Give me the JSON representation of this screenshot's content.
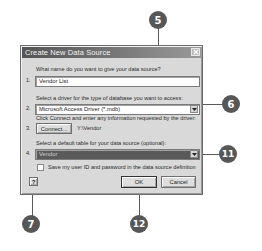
{
  "dialog": {
    "title": "Create New Data Source",
    "close_label": "×",
    "steps": [
      {
        "number": "1.",
        "label": "What name do you want to give your data source?",
        "value": "Vendor List"
      },
      {
        "number": "2.",
        "label": "Select a driver for the type of database you want to access:",
        "value": "Microsoft Access Driver (*.mdb)"
      },
      {
        "number": "3.",
        "label": "Click Connect and enter any information requested by the driver:",
        "button": "Connect...",
        "path": "Y:\\Vendor"
      },
      {
        "number": "4.",
        "label": "Select a default table for your data source (optional):",
        "value": "Vendor"
      }
    ],
    "checkbox": {
      "label": "Save my user ID and password in the data source definition",
      "checked": false
    },
    "help_icon": "?",
    "ok_label": "OK",
    "cancel_label": "Cancel"
  },
  "callouts": [
    {
      "id": "5",
      "label": "5"
    },
    {
      "id": "6",
      "label": "6"
    },
    {
      "id": "11",
      "label": "11"
    },
    {
      "id": "7",
      "label": "7"
    },
    {
      "id": "12",
      "label": "12"
    }
  ],
  "colors": {
    "callout_fill": "#575757",
    "titlebar": "#555555",
    "dialog_bg": "#d9d9d9",
    "selected_field": "#5a5a5a"
  }
}
